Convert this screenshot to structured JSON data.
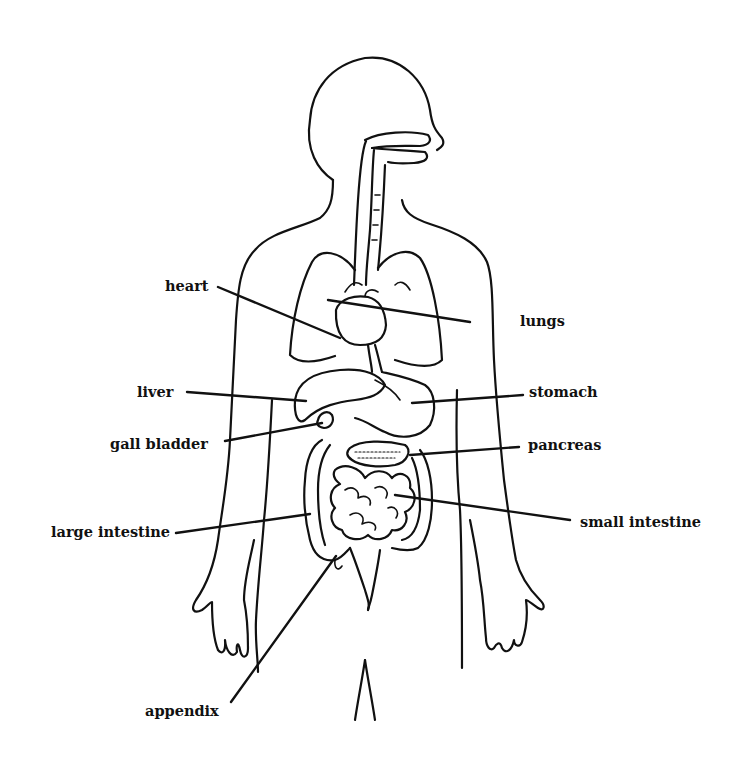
{
  "diagram": {
    "labels": {
      "heart": "heart",
      "lungs": "lungs",
      "liver": "liver",
      "stomach": "stomach",
      "gall_bladder": "gall bladder",
      "pancreas": "pancreas",
      "large_intestine": "large intestine",
      "small_intestine": "small intestine",
      "appendix": "appendix"
    }
  }
}
